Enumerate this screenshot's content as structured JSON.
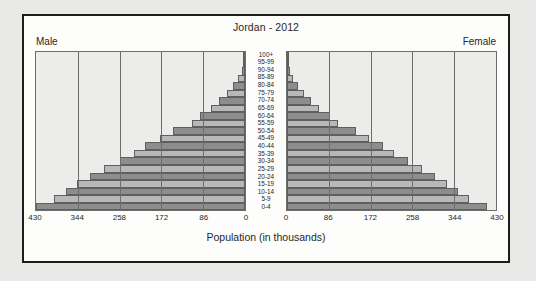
{
  "chart_data": {
    "type": "bar",
    "subtype": "population-pyramid",
    "title": "Jordan - 2012",
    "xlabel": "Population (in thousands)",
    "ylabel": "",
    "grid": true,
    "legend_position": "corners",
    "left_label": "Male",
    "right_label": "Female",
    "xlim": [
      0,
      430
    ],
    "xticks": [
      0,
      86,
      172,
      258,
      344,
      430
    ],
    "xtick_labels_left": [
      "430",
      "344",
      "258",
      "172",
      "86",
      "0"
    ],
    "xtick_labels_right": [
      "0",
      "86",
      "172",
      "258",
      "344",
      "430"
    ],
    "categories": [
      "100+",
      "95-99",
      "90-94",
      "85-89",
      "80-84",
      "75-79",
      "70-74",
      "65-69",
      "60-64",
      "55-59",
      "50-54",
      "45-49",
      "40-44",
      "35-39",
      "30-34",
      "25-29",
      "20-24",
      "15-19",
      "10-14",
      "5-9",
      "0-4"
    ],
    "series": [
      {
        "name": "Male",
        "side": "left",
        "values": [
          1,
          3,
          7,
          14,
          24,
          38,
          53,
          70,
          92,
          110,
          148,
          175,
          205,
          228,
          258,
          290,
          318,
          345,
          368,
          392,
          430
        ]
      },
      {
        "name": "Female",
        "side": "right",
        "values": [
          1,
          3,
          7,
          13,
          22,
          35,
          49,
          66,
          88,
          105,
          142,
          168,
          198,
          220,
          248,
          278,
          305,
          330,
          352,
          375,
          412
        ]
      }
    ],
    "colors": {
      "bar_dark": "#8d8d8d",
      "bar_light": "#b8b8b8",
      "plot_background": "#ececea",
      "gridline": "#6d6d6d",
      "card_background": "#fdfdfb",
      "card_border": "#1c1c1c",
      "page_background": "#e9e9e7",
      "text": "#272727"
    }
  }
}
